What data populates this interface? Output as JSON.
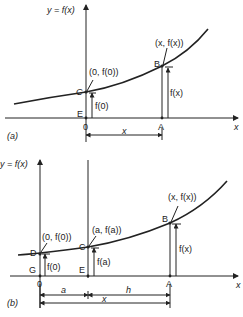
{
  "figure": {
    "panel_a": {
      "tag": "(a)",
      "y_axis_label": "y = f(x)",
      "x_axis_label": "x",
      "origin_label": "0",
      "points": {
        "C": {
          "label": "C",
          "coord": "(0, f(0))"
        },
        "B": {
          "label": "B",
          "coord": "(x, f(x))"
        },
        "E": {
          "label": "E"
        },
        "A": {
          "label": "A"
        }
      },
      "heights": {
        "f0": "f(0)",
        "fx": "f(x)"
      },
      "dimension": {
        "x": "x"
      }
    },
    "panel_b": {
      "tag": "(b)",
      "y_axis_label": "y = f(x)",
      "x_axis_label": "x",
      "origin_label": "0",
      "points": {
        "D": {
          "label": "D",
          "coord": "(0, f(0))"
        },
        "C": {
          "label": "C",
          "coord": "(a, f(a))"
        },
        "B": {
          "label": "B",
          "coord": "(x, f(x))"
        },
        "G": {
          "label": "G"
        },
        "E": {
          "label": "E"
        },
        "A": {
          "label": "A"
        }
      },
      "heights": {
        "f0": "f(0)",
        "fa": "f(a)",
        "fx": "f(x)"
      },
      "dimension": {
        "a": "a",
        "h": "h",
        "x": "x"
      }
    },
    "colors": {
      "ink": "#222222",
      "background": "#ffffff"
    }
  }
}
